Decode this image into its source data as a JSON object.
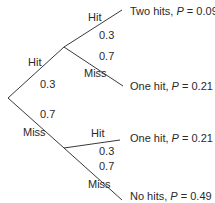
{
  "diagram": {
    "type": "probability-tree",
    "line_color": "#3a3a3a",
    "text_color": "#2a2a2a",
    "first_shot": {
      "hit": {
        "label": "Hit",
        "prob": "0.3"
      },
      "miss": {
        "label": "Miss",
        "prob": "0.7"
      }
    },
    "after_hit": {
      "hit": {
        "label": "Hit",
        "prob": "0.3"
      },
      "miss": {
        "label": "Miss",
        "prob": "0.7"
      }
    },
    "after_miss": {
      "hit": {
        "label": "Hit",
        "prob": "0.3"
      },
      "miss": {
        "label": "Miss",
        "prob": "0.7"
      }
    },
    "outcomes": [
      {
        "text": "Two hits, ",
        "p_symbol": "P",
        "eq": " = 0.09"
      },
      {
        "text": "One hit, ",
        "p_symbol": "P",
        "eq": " = 0.21"
      },
      {
        "text": "One hit, ",
        "p_symbol": "P",
        "eq": " = 0.21"
      },
      {
        "text": "No hits, ",
        "p_symbol": "P",
        "eq": " = 0.49"
      }
    ]
  }
}
